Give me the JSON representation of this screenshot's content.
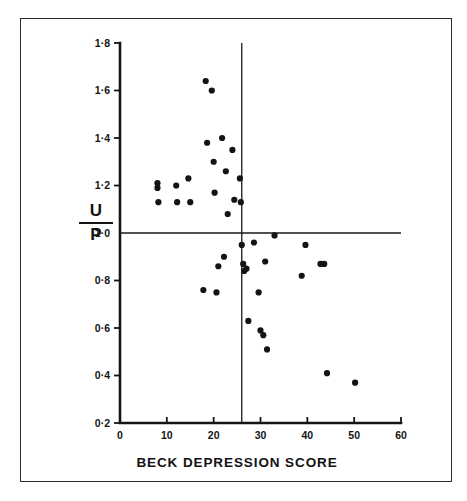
{
  "chart_data": {
    "type": "scatter",
    "title": "",
    "xlabel": "BECK DEPRESSION SCORE",
    "ylabel": "U/P",
    "ylabel_numerator": "U",
    "ylabel_denominator": "P",
    "xlim": [
      0,
      60
    ],
    "ylim": [
      0.2,
      1.8
    ],
    "xticks": [
      0,
      10,
      20,
      30,
      40,
      50,
      60
    ],
    "xtick_labels": [
      "0",
      "10",
      "20",
      "30",
      "40",
      "50",
      "60"
    ],
    "yticks": [
      0.2,
      0.4,
      0.6,
      0.8,
      1.0,
      1.2,
      1.4,
      1.6,
      1.8
    ],
    "ytick_labels": [
      "0·2",
      "0·4",
      "0·6",
      "0·8",
      "1·0",
      "1·2",
      "1·4",
      "1·6",
      "1·8"
    ],
    "grid": false,
    "legend": false,
    "marker": "filled-circle",
    "marker_color": "#141414",
    "reference_lines": [
      {
        "orientation": "vertical",
        "value": 26,
        "label": "",
        "color": "#1a1a1a"
      },
      {
        "orientation": "horizontal",
        "value": 1.0,
        "label": "",
        "color": "#1a1a1a"
      }
    ],
    "points": [
      {
        "x": 8.0,
        "y": 1.21
      },
      {
        "x": 8.0,
        "y": 1.19
      },
      {
        "x": 8.2,
        "y": 1.13
      },
      {
        "x": 12.0,
        "y": 1.2
      },
      {
        "x": 12.2,
        "y": 1.13
      },
      {
        "x": 14.6,
        "y": 1.23
      },
      {
        "x": 15.0,
        "y": 1.13
      },
      {
        "x": 17.8,
        "y": 0.76
      },
      {
        "x": 18.3,
        "y": 1.64
      },
      {
        "x": 18.6,
        "y": 1.38
      },
      {
        "x": 19.6,
        "y": 1.6
      },
      {
        "x": 20.0,
        "y": 1.3
      },
      {
        "x": 20.2,
        "y": 1.17
      },
      {
        "x": 20.6,
        "y": 0.75
      },
      {
        "x": 21.0,
        "y": 0.86
      },
      {
        "x": 21.8,
        "y": 1.4
      },
      {
        "x": 22.2,
        "y": 0.9
      },
      {
        "x": 22.6,
        "y": 1.26
      },
      {
        "x": 23.0,
        "y": 1.08
      },
      {
        "x": 24.0,
        "y": 1.35
      },
      {
        "x": 24.4,
        "y": 1.14
      },
      {
        "x": 25.6,
        "y": 1.23
      },
      {
        "x": 25.8,
        "y": 1.13
      },
      {
        "x": 26.0,
        "y": 0.95
      },
      {
        "x": 26.3,
        "y": 0.87
      },
      {
        "x": 26.5,
        "y": 0.84
      },
      {
        "x": 27.0,
        "y": 0.85
      },
      {
        "x": 27.4,
        "y": 0.63
      },
      {
        "x": 28.6,
        "y": 0.96
      },
      {
        "x": 29.6,
        "y": 0.75
      },
      {
        "x": 30.0,
        "y": 0.59
      },
      {
        "x": 30.6,
        "y": 0.57
      },
      {
        "x": 31.0,
        "y": 0.88
      },
      {
        "x": 31.4,
        "y": 0.51
      },
      {
        "x": 33.0,
        "y": 0.99
      },
      {
        "x": 38.8,
        "y": 0.82
      },
      {
        "x": 39.6,
        "y": 0.95
      },
      {
        "x": 42.8,
        "y": 0.87
      },
      {
        "x": 43.6,
        "y": 0.87
      },
      {
        "x": 44.2,
        "y": 0.41
      },
      {
        "x": 50.2,
        "y": 0.37
      }
    ]
  }
}
